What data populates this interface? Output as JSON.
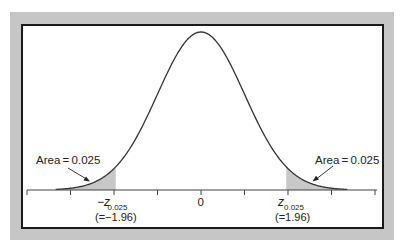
{
  "chart_data": {
    "type": "area",
    "title": "",
    "xlabel": "",
    "ylabel": "",
    "distribution": "standard normal",
    "mean": 0,
    "sd": 1,
    "x_range": [
      -4,
      4
    ],
    "x_ticks": [
      -4,
      -3,
      -2,
      -1,
      0,
      1,
      2,
      3,
      4
    ],
    "tick_labels": [
      {
        "x": -1.96,
        "main": "−z",
        "sub": "0.025",
        "value_label": "(=−1.96)"
      },
      {
        "x": 0,
        "main": "0",
        "sub": "",
        "value_label": ""
      },
      {
        "x": 1.96,
        "main": "z",
        "sub": "0.025",
        "value_label": "(=1.96)"
      }
    ],
    "shaded_regions": [
      {
        "from": -4,
        "to": -1.96,
        "area": 0.025,
        "annotation": "Area = 0.025"
      },
      {
        "from": 1.96,
        "to": 4,
        "area": 0.025,
        "annotation": "Area = 0.025"
      }
    ],
    "grid": false,
    "legend": null
  },
  "annotations": {
    "left_area": "Area = 0.025",
    "right_area": "Area = 0.025"
  },
  "axis_labels": {
    "neg_z": "−z",
    "neg_z_sub": "0.025",
    "neg_z_value": "(=−1.96)",
    "zero": "0",
    "pos_z": "z",
    "pos_z_sub": "0.025",
    "pos_z_value": "(=1.96)"
  },
  "colors": {
    "frame": "#c6c6c6",
    "border": "#1a1a1a",
    "curve": "#333333",
    "shade": "#c8c8c8",
    "axis": "#444444"
  }
}
